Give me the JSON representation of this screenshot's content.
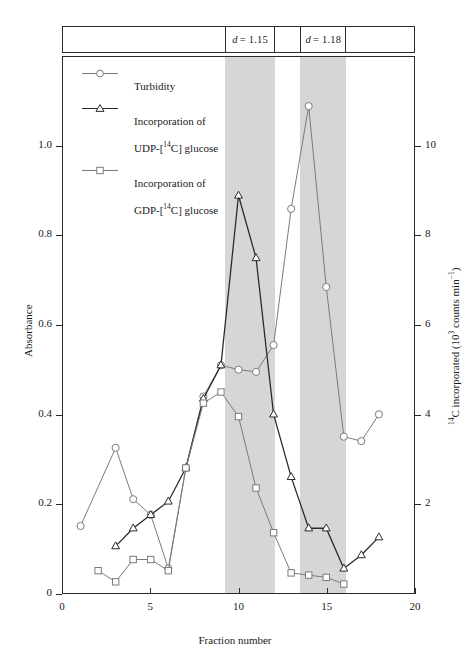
{
  "chart_data": {
    "type": "line",
    "title": "",
    "xlabel": "Fraction number",
    "ylabel": "Absorbance",
    "y2label": "14C incorporated (10^3 counts min^-1)",
    "xlim": [
      0,
      20
    ],
    "ylim": [
      0,
      1.2
    ],
    "y2lim": [
      0,
      12
    ],
    "grid": false,
    "legend_position": "top-left",
    "xticks": [
      "0",
      "5",
      "10",
      "15",
      "20"
    ],
    "xtick_values": [
      0,
      5,
      10,
      15,
      20
    ],
    "yticks": [
      "0",
      "0.2",
      "0.4",
      "0.6",
      "0.8",
      "1.0"
    ],
    "ytick_values": [
      0,
      0.2,
      0.4,
      0.6,
      0.8,
      1.0
    ],
    "y2ticks": [
      "2",
      "4",
      "6",
      "8",
      "10"
    ],
    "y2tick_values": [
      2,
      4,
      6,
      8,
      10
    ],
    "bands": [
      {
        "label": "d = 1.15",
        "label_italic_prefix": "d",
        "label_rest": " = 1.15",
        "x_start": 9.2,
        "x_end": 12.0,
        "color": "#d6d6d6"
      },
      {
        "label": "d = 1.18",
        "label_italic_prefix": "d",
        "label_rest": " = 1.18",
        "x_start": 13.45,
        "x_end": 16.05,
        "color": "#d6d6d6"
      }
    ],
    "series": [
      {
        "name": "Turbidity",
        "axis": "left",
        "marker": "circle",
        "color": "#7a7a7a",
        "x": [
          1,
          3,
          4,
          5,
          6,
          7,
          8,
          9,
          10,
          11,
          12,
          13,
          14,
          15,
          16,
          17,
          18
        ],
        "values": [
          0.15,
          0.325,
          0.21,
          0.175,
          0.055,
          0.28,
          0.44,
          0.51,
          0.5,
          0.495,
          0.555,
          0.86,
          1.09,
          0.685,
          0.35,
          0.34,
          0.4
        ]
      },
      {
        "name": "Incorporation of UDP-[14C] glucose",
        "axis": "right",
        "marker": "triangle",
        "color": "#2a2a2a",
        "x": [
          3,
          4,
          5,
          6,
          7,
          8,
          9,
          10,
          11,
          12,
          13,
          14,
          15,
          16,
          17,
          18
        ],
        "values": [
          1.05,
          1.45,
          1.75,
          2.05,
          2.8,
          4.35,
          5.1,
          8.9,
          7.5,
          4.0,
          2.6,
          1.45,
          1.45,
          0.55,
          0.85,
          1.25
        ]
      },
      {
        "name": "Incorporation of GDP-[14C] glucose",
        "axis": "right",
        "marker": "square",
        "color": "#7a7a7a",
        "x": [
          2,
          3,
          4,
          5,
          6,
          7,
          8,
          9,
          10,
          11,
          12,
          13,
          14,
          15,
          16
        ],
        "values": [
          0.5,
          0.25,
          0.75,
          0.75,
          0.5,
          2.8,
          4.25,
          4.5,
          3.95,
          2.35,
          1.35,
          0.45,
          0.4,
          0.35,
          0.2
        ]
      }
    ]
  },
  "axes": {
    "x_title": "Fraction number",
    "y_left_title": "Absorbance",
    "y_right_title_main": "C incorporated (10",
    "y_right_sup_1": "14",
    "y_right_sup_2": "3",
    "y_right_title_tail": " counts min",
    "y_right_sup_3": "−1",
    "y_right_title_close": ")"
  },
  "legend": {
    "items": [
      {
        "marker": "circle",
        "label": "Turbidity",
        "label_line1": "Turbidity",
        "label_line2": ""
      },
      {
        "marker": "triangle",
        "label": "Incorporation of UDP-[14C] glucose",
        "label_line1": "Incorporation of",
        "label_line2_pre": "UDP-[",
        "label_line2_sup": "14",
        "label_line2_post": "C] glucose"
      },
      {
        "marker": "square",
        "label": "Incorporation of GDP-[14C] glucose",
        "label_line1": "Incorporation of",
        "label_line2_pre": "GDP-[",
        "label_line2_sup": "14",
        "label_line2_post": "C] glucose"
      }
    ]
  },
  "colors": {
    "frame": "#2a2a2a",
    "band": "#d6d6d6",
    "turbidity": "#7a7a7a",
    "udp": "#2a2a2a",
    "gdp": "#7a7a7a",
    "background": "#ffffff"
  }
}
